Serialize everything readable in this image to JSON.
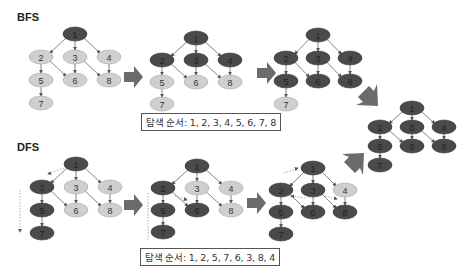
{
  "sections": {
    "bfs": {
      "title": "BFS",
      "order_text": "탐색 순서: 1, 2, 3, 4, 5, 6, 7, 8",
      "order": [
        1,
        2,
        3,
        4,
        5,
        6,
        7,
        8
      ]
    },
    "dfs": {
      "title": "DFS",
      "order_text": "탐색 순서: 1, 2, 5, 7, 6, 3, 8, 4",
      "order": [
        1,
        2,
        5,
        7,
        6,
        3,
        8,
        4
      ]
    }
  },
  "graph": {
    "nodes": [
      "1",
      "2",
      "3",
      "4",
      "5",
      "6",
      "7",
      "8"
    ],
    "edges": [
      [
        "1",
        "2"
      ],
      [
        "1",
        "3"
      ],
      [
        "1",
        "4"
      ],
      [
        "2",
        "5"
      ],
      [
        "2",
        "6"
      ],
      [
        "3",
        "6"
      ],
      [
        "3",
        "8"
      ],
      [
        "4",
        "8"
      ],
      [
        "5",
        "7"
      ]
    ]
  },
  "colors": {
    "visited": "#4a4a4a",
    "unvisited": "#cfcfcf",
    "edge": "#666666",
    "arrow": "#6b6b6b"
  },
  "steps": [
    {
      "id": "bfs-1",
      "visited": [
        "1"
      ]
    },
    {
      "id": "bfs-2",
      "visited": [
        "1",
        "2",
        "3",
        "4"
      ]
    },
    {
      "id": "bfs-3",
      "visited": [
        "1",
        "2",
        "3",
        "4",
        "5",
        "6",
        "8"
      ]
    },
    {
      "id": "final",
      "visited": [
        "1",
        "2",
        "3",
        "4",
        "5",
        "6",
        "7",
        "8"
      ]
    },
    {
      "id": "dfs-1",
      "visited": [
        "1",
        "2",
        "5",
        "7"
      ]
    },
    {
      "id": "dfs-2",
      "visited": [
        "1",
        "2",
        "5",
        "7",
        "6"
      ]
    },
    {
      "id": "dfs-3",
      "visited": [
        "1",
        "2",
        "3",
        "5",
        "6",
        "7",
        "8"
      ]
    }
  ]
}
